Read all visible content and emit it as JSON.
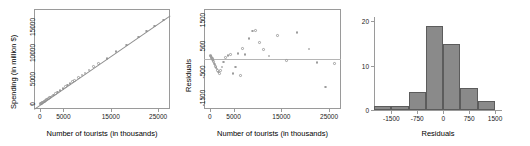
{
  "figure": {
    "panel_count": 3,
    "background": "#ffffff",
    "point_color": "#9c9c9c",
    "line_color": "#8d8d8d",
    "bar_fill": "#8a8a8a",
    "bar_border": "#5c5c5c",
    "axis_color": "#9a9a9a"
  },
  "chart_data": [
    {
      "type": "scatter",
      "title": "",
      "xlabel": "Number of tourists (in thousands)",
      "ylabel": "Spending (in million $)",
      "xlim": [
        -1200,
        27500
      ],
      "ylim": [
        -900,
        18500
      ],
      "xticks": [
        0,
        5000,
        15000,
        25000
      ],
      "xticklabels": [
        "0",
        "5000",
        "15000",
        "25000"
      ],
      "yticks": [
        0,
        5000,
        10000,
        15000
      ],
      "yticklabels": [
        "0",
        "5000",
        "10000",
        "15000"
      ],
      "grid": false,
      "legend": "none",
      "has_regression_line": true,
      "regression": {
        "intercept": -150,
        "slope": 0.632
      },
      "x": [
        120,
        210,
        290,
        360,
        430,
        520,
        610,
        700,
        790,
        880,
        980,
        1080,
        1200,
        1350,
        1500,
        1680,
        1850,
        2050,
        2300,
        2600,
        2900,
        3300,
        3800,
        4300,
        4900,
        5400,
        5900,
        6400,
        6900,
        7400,
        8200,
        8900,
        9600,
        10400,
        11300,
        12400,
        14200,
        16100,
        18300,
        20800,
        22500,
        24200,
        26100
      ],
      "y": [
        60,
        110,
        170,
        210,
        260,
        310,
        370,
        420,
        480,
        540,
        600,
        660,
        740,
        840,
        930,
        1050,
        1150,
        1280,
        1440,
        1630,
        1810,
        2070,
        2380,
        2700,
        3060,
        3420,
        3740,
        4020,
        4380,
        4660,
        5250,
        5720,
        6100,
        6700,
        7300,
        7900,
        8950,
        10200,
        11550,
        13050,
        14200,
        15200,
        16350
      ]
    },
    {
      "type": "scatter",
      "title": "",
      "xlabel": "Number of tourists (in thousands)",
      "ylabel": "Residuals",
      "xlim": [
        -1200,
        27500
      ],
      "ylim": [
        -1900,
        1900
      ],
      "xticks": [
        0,
        5000,
        15000,
        25000
      ],
      "xticklabels": [
        "0",
        "5000",
        "15000",
        "25000"
      ],
      "yticks": [
        -1500,
        -500,
        500,
        1500
      ],
      "yticklabels": [
        "-1500",
        "-500",
        "500",
        "1500"
      ],
      "grid": false,
      "legend": "none",
      "reference_line_y": 0,
      "x": [
        120,
        210,
        290,
        360,
        430,
        520,
        610,
        700,
        790,
        880,
        980,
        1080,
        1200,
        1350,
        1500,
        1680,
        1850,
        2050,
        2300,
        2600,
        2900,
        3300,
        3800,
        4300,
        4900,
        5400,
        5900,
        6400,
        6900,
        7400,
        8200,
        8900,
        9600,
        10400,
        11300,
        12400,
        14200,
        16100,
        18300,
        20800,
        22500,
        24200,
        26100
      ],
      "y": [
        135,
        120,
        95,
        60,
        35,
        10,
        -20,
        -60,
        -100,
        -150,
        -190,
        -230,
        -280,
        -330,
        -380,
        -430,
        -490,
        -540,
        -430,
        -300,
        -120,
        60,
        130,
        160,
        -560,
        -300,
        220,
        -620,
        390,
        170,
        780,
        1060,
        1090,
        620,
        350,
        120,
        900,
        -50,
        1000,
        380,
        -140,
        -1070,
        -170
      ]
    },
    {
      "type": "bar",
      "subtype": "histogram",
      "title": "",
      "xlabel": "Residuals",
      "ylabel": "",
      "xlim": [
        -2000,
        1700
      ],
      "ylim": [
        0,
        21
      ],
      "xticks": [
        -1500,
        -750,
        0,
        750,
        1500
      ],
      "xticklabels": [
        "-1500",
        "-750",
        "0",
        "750",
        "1500"
      ],
      "yticks": [
        0,
        10,
        20
      ],
      "yticklabels": [
        "0",
        "10",
        "20"
      ],
      "grid": false,
      "legend": "none",
      "bin_width": 500,
      "bin_edges": [
        -2000,
        -1500,
        -1000,
        -500,
        0,
        500,
        1000,
        1500
      ],
      "categories": [
        "-2000 to -1500",
        "-1500 to -1000",
        "-1000 to -500",
        "-500 to 0",
        "0 to 500",
        "500 to 1000",
        "1000 to 1500"
      ],
      "values": [
        1,
        1,
        4,
        19,
        15,
        5,
        2
      ]
    }
  ]
}
